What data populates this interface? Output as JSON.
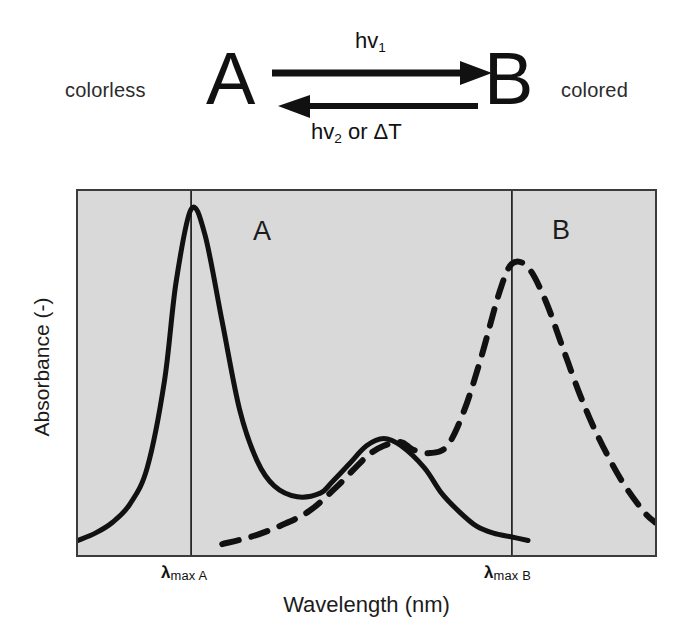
{
  "scheme": {
    "left_state_label": "colorless",
    "right_state_label": "colored",
    "species_a": "A",
    "species_b": "B",
    "forward_caption_main": "hv",
    "forward_caption_sub": "1",
    "reverse_caption_main": "hv",
    "reverse_caption_sub": "2",
    "reverse_caption_tail": " or ΔT",
    "forward_arrow_icon": "arrow-right-icon",
    "reverse_arrow_icon": "arrow-left-icon"
  },
  "chart_data": {
    "type": "line",
    "title": "",
    "xlabel": "Wavelength (nm)",
    "ylabel": "Absorbance (-)",
    "grid": false,
    "legend_position": "inline-annotation",
    "xlim": [
      0,
      100
    ],
    "ylim": [
      0,
      100
    ],
    "xtick_labels": [
      "λmax A",
      "λmax B"
    ],
    "xtick_positions": [
      19.6,
      75.2
    ],
    "ytick_labels": [],
    "annotations": [
      {
        "text": "A",
        "x": 31,
        "y": 88,
        "series": "A"
      },
      {
        "text": "B",
        "x": 82,
        "y": 88,
        "series": "B"
      }
    ],
    "series": [
      {
        "name": "A",
        "label": "A",
        "style": "solid",
        "color": "#111111",
        "description": "Colorless form A: intense narrow absorption band at lambda-max A with a weaker secondary shoulder band at longer wavelength, decaying to baseline.",
        "x": [
          0,
          3,
          6,
          9,
          12,
          15,
          17,
          19.6,
          22,
          25,
          28,
          31,
          34,
          38,
          42,
          44,
          47,
          50,
          53,
          56,
          60,
          63,
          66,
          69,
          72,
          75,
          78
        ],
        "y": [
          4,
          6,
          9,
          14,
          24,
          48,
          75,
          95,
          88,
          64,
          40,
          26,
          19,
          16,
          17,
          20,
          25,
          30,
          32,
          30,
          24,
          17,
          12,
          8,
          6,
          5,
          4
        ]
      },
      {
        "name": "B",
        "label": "B",
        "style": "dashed",
        "color": "#111111",
        "description": "Colored form B: low broad band in the mid region, dipping slightly, then rising to an intense broad peak at lambda-max B before decaying.",
        "x": [
          25,
          30,
          35,
          40,
          45,
          50,
          53,
          56,
          58,
          61,
          64,
          67,
          70,
          73,
          75.2,
          78,
          81,
          84,
          87,
          90,
          94,
          98,
          100
        ],
        "y": [
          3,
          5,
          8,
          12,
          19,
          27,
          30,
          31,
          29,
          28,
          30,
          40,
          55,
          72,
          80,
          79,
          70,
          57,
          44,
          33,
          21,
          12,
          9
        ]
      }
    ]
  }
}
